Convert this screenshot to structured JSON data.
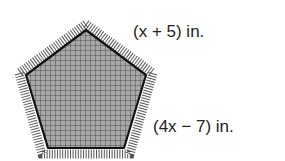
{
  "figure": {
    "shape": "regular-pentagon-rug",
    "fill_color": "#9a9a9a",
    "grid_color": "#3a3a3a",
    "outline_color": "#111111",
    "labels": {
      "top_side": "(x + 5) in.",
      "right_side": "(4x − 7) in."
    }
  }
}
